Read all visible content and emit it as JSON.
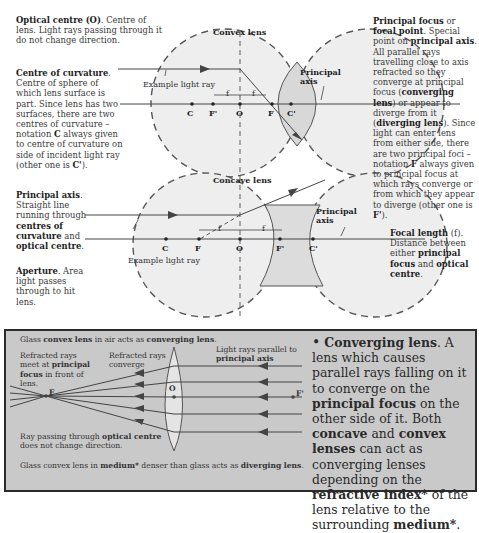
{
  "top_diagram": {
    "convex_title": "Convex lens",
    "concave_title": "Concave lens",
    "example_ray_1": "Example light ray",
    "example_ray_2": "Example light ray",
    "principal_axis_label_1": "Principal axis",
    "principal_axis_label_2": "Principal axis",
    "convex_points": [
      "C",
      "F'",
      "O",
      "F",
      "C'"
    ],
    "concave_points": [
      "C",
      "F",
      "O",
      "F'",
      "C'"
    ],
    "focal_marker": "f"
  },
  "annotations": {
    "optical_centre": {
      "term": "Optical centre",
      "abbr": "(O)",
      "text": ". Centre of lens. Light rays passing through it do not change direction."
    },
    "centre_of_curvature": {
      "term": "Centre of curvature",
      "text_1": ". Centre of sphere of which lens surface is part. Since lens has two surfaces, there are two centres of curvature – notation ",
      "c": "C",
      "text_2": " always given to centre of curvature on side of incident light ray (other one is ",
      "c_prime": "C'",
      "text_3": ")."
    },
    "principal_axis": {
      "term": "Principal axis",
      "text_1": ". Straight line running through ",
      "b1": "centres of curvature",
      "text_2": " and ",
      "b2": "optical centre",
      "text_3": "."
    },
    "aperture": {
      "term": "Aperture",
      "text": ". Area light passes through to hit lens."
    },
    "principal_focus": {
      "term_1": "Principal focus",
      "or": " or ",
      "term_2": "focal point",
      "text_1": ". Special point on ",
      "b1": "principal axis",
      "text_2": ". All parallel rays travelling close to axis refracted so they converge at principal focus (",
      "b2": "converging lens",
      "text_3": ") or appear to diverge from it (",
      "b3": "diverging lens",
      "text_4": "). Since light can enter lens from either side, there are two principal foci – notation ",
      "b4": "F",
      "text_5": " always given to principal focus at which rays converge or from which they appear to diverge (other one is ",
      "b5": "F'",
      "text_6": ")."
    },
    "focal_length": {
      "term": "Focal length",
      "abbr": "(f)",
      "text_1": ". Distance between either ",
      "b1": "principal focus",
      "text_2": " and ",
      "b2": "optical centre",
      "text_3": "."
    }
  },
  "panel": {
    "header": {
      "t1": "Glass ",
      "b1": "convex lens",
      "t2": " in air acts as ",
      "b2": "converging lens",
      "t3": "."
    },
    "refracted_meet": {
      "t1": "Refracted rays meet at ",
      "b1": "principal focus",
      "t2": " in front of lens."
    },
    "refracted_converge": "Refracted rays converge",
    "parallel_rays": {
      "t1": "Light rays parallel to ",
      "b1": "principal axis"
    },
    "ray_optical_centre": {
      "t1": "Ray passing through ",
      "b1": "optical centre",
      "t2": " does not change direction."
    },
    "footer": {
      "t1": "Glass convex lens in ",
      "b1": "medium*",
      "t2": " denser than glass acts as ",
      "b2": "diverging lens",
      "t3": "."
    },
    "points": {
      "F": "F",
      "O": "O",
      "F_prime": "F'"
    },
    "bullet": {
      "bullet": "•",
      "term": "Converging lens",
      "t1": ". A lens which causes parallel rays falling on it to converge on the ",
      "b1": "principal focus",
      "t2": " on the other side of it. Both ",
      "b2": "concave",
      "t3": " and ",
      "b3": "convex lenses",
      "t4": " can act as converging lenses depending on the ",
      "b4": "refractive index*",
      "t5": " of the lens relative to the surrounding ",
      "b5": "medium*",
      "t6": "."
    }
  },
  "colors": {
    "panel_bg": "#c9c9c9",
    "sphere_fill": "#ececec",
    "line": "#444444",
    "text": "#333333"
  }
}
